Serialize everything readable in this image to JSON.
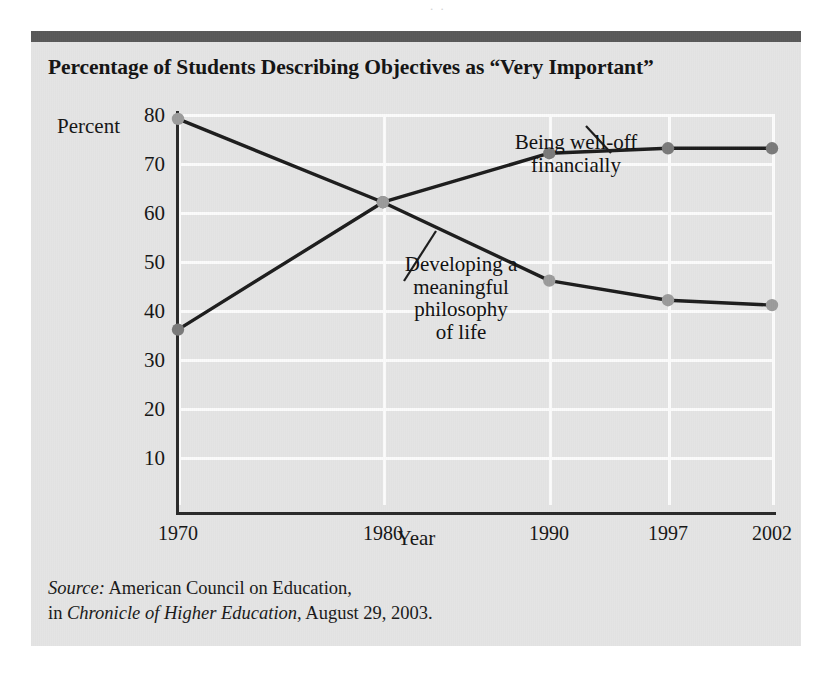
{
  "bleed_text": "    .             .       ",
  "figure": {
    "title": "Percentage of Students Describing Objectives as “Very Important”",
    "source": {
      "label": "Source:",
      "line1_rest": " American Council on Education,",
      "line2_prefix": "in ",
      "line2_italic": "Chronicle of Higher Education,",
      "line2_rest": " August 29, 2003."
    }
  },
  "chart_data": {
    "type": "line",
    "title": "Percentage of Students Describing Objectives as “Very Important”",
    "xlabel": "Year",
    "ylabel": "Percent",
    "categories": [
      "1970",
      "1980",
      "1990",
      "1997",
      "2002"
    ],
    "x_positions_pct": [
      0,
      34.5,
      62.5,
      82.5,
      100
    ],
    "ylim": [
      0,
      80
    ],
    "yticks": [
      10,
      20,
      30,
      40,
      50,
      60,
      70,
      80
    ],
    "grid": true,
    "legend_position": "inline-annotations",
    "series": [
      {
        "name": "Being well-off financially",
        "values": [
          36,
          62,
          72,
          73,
          73
        ],
        "color": "#7a7a7a",
        "line_color": "#1d1d1d"
      },
      {
        "name": "Developing a meaningful philosophy of life",
        "values": [
          79,
          62,
          46,
          42,
          41
        ],
        "color": "#9b9b9b",
        "line_color": "#1d1d1d"
      }
    ],
    "annotations": [
      {
        "text_lines": [
          "Being well-off",
          "financially"
        ],
        "series": "Being well-off financially"
      },
      {
        "text_lines": [
          "Developing a",
          "meaningful",
          "philosophy",
          "of life"
        ],
        "series": "Developing a meaningful philosophy of life"
      }
    ]
  },
  "colors": {
    "panel_background": "#e4e4e4",
    "top_bar": "#595959",
    "gridline": "#fbfbfb",
    "axis": "#2a2a2a",
    "text": "#161616"
  }
}
